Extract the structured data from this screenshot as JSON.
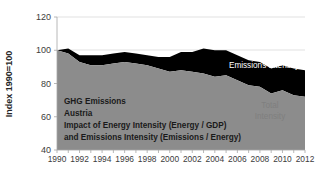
{
  "chart_data": {
    "type": "area",
    "title": "",
    "subtitle": "",
    "xlabel": "",
    "ylabel": "Index 1990=100",
    "ylim": [
      40,
      120
    ],
    "ytick_labels": [
      "120",
      "100",
      "80",
      "60",
      "40"
    ],
    "ytick_values": [
      120,
      100,
      80,
      60,
      40
    ],
    "xlim": [
      1990,
      2012
    ],
    "grid": true,
    "legend_position": "inline-labels",
    "x": [
      1990,
      1991,
      1992,
      1993,
      1994,
      1995,
      1996,
      1997,
      1998,
      1999,
      2000,
      2001,
      2002,
      2003,
      2004,
      2005,
      2006,
      2007,
      2008,
      2009,
      2010,
      2011,
      2012
    ],
    "xtick_labels": [
      "1990",
      "1992",
      "1994",
      "1996",
      "1998",
      "2000",
      "2002",
      "2004",
      "2006",
      "2008",
      "2010",
      "2012"
    ],
    "xtick_values": [
      1990,
      1992,
      1994,
      1996,
      1998,
      2000,
      2002,
      2004,
      2006,
      2008,
      2010,
      2012
    ],
    "stacking": "the black band top edge is the GHG emissions index; the gray band top edge is the Total Intensity index",
    "series": [
      {
        "name": "Energy-Intensity",
        "role": "upper-band-top-edge",
        "color": "#000000",
        "values": [
          100,
          101,
          97,
          97,
          97,
          98,
          99,
          98,
          97,
          96,
          96,
          99,
          99,
          101,
          100,
          100,
          97,
          94,
          93,
          89,
          91,
          89,
          88
        ]
      },
      {
        "name": "Emissions Intensity",
        "role": "lower-band-top-edge",
        "color": "#8c8c8c",
        "values": [
          100,
          98,
          93,
          91,
          91,
          92,
          93,
          92,
          91,
          89,
          87,
          88,
          87,
          86,
          84,
          85,
          82,
          79,
          78,
          74,
          76,
          73,
          72
        ]
      }
    ],
    "annotations": {
      "energy_intensity_label": "Energy-Intensity",
      "emissions_intensity_label": "Emissions Intensity",
      "total_intensity_label_line1": "Total",
      "total_intensity_label_line2": "Intensity"
    },
    "caption_lines": [
      "GHG Emissions",
      "Austria",
      "Impact of Energy Intensity (Energy / GDP)",
      "and Emissions Intensity (Emissions / Energy)"
    ],
    "colors": {
      "energy_band": "#000000",
      "emissions_band": "#8c8c8c",
      "background": "#ffffff",
      "gridline": "#d9d9d9",
      "axis": "#a6a6a6",
      "text": "#3c3c3c"
    }
  }
}
